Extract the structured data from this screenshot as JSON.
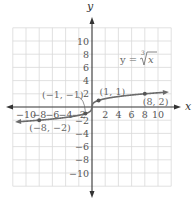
{
  "chart_data": {
    "type": "line",
    "title": "",
    "function": "y = cbrt(x)",
    "equation_label": {
      "prefix": "y = ",
      "index": "3",
      "radicand": "x"
    },
    "xlabel": "x",
    "ylabel": "y",
    "xlim": [
      -12,
      12
    ],
    "ylim": [
      -12,
      12
    ],
    "grid": true,
    "grid_step": 2,
    "x_ticks": [
      {
        "value": -10,
        "label": "−10"
      },
      {
        "value": -8,
        "label": "−8"
      },
      {
        "value": -6,
        "label": "−6"
      },
      {
        "value": -4,
        "label": "−4"
      },
      {
        "value": -2,
        "label": "−2"
      },
      {
        "value": 2,
        "label": "2"
      },
      {
        "value": 4,
        "label": "4"
      },
      {
        "value": 6,
        "label": "6"
      },
      {
        "value": 8,
        "label": "8"
      },
      {
        "value": 10,
        "label": "10"
      }
    ],
    "y_ticks": [
      {
        "value": 10,
        "label": "10"
      },
      {
        "value": 8,
        "label": "8"
      },
      {
        "value": 6,
        "label": "6"
      },
      {
        "value": 4,
        "label": "4"
      },
      {
        "value": 2,
        "label": "2"
      },
      {
        "value": -2,
        "label": "−2"
      },
      {
        "value": -4,
        "label": "−4"
      },
      {
        "value": -6,
        "label": "−6"
      },
      {
        "value": -8,
        "label": "−8"
      },
      {
        "value": -10,
        "label": "−10"
      }
    ],
    "series": [
      {
        "name": "y = ∛x",
        "x_range": [
          -11.2,
          11.2
        ],
        "arrows": "both",
        "color": "#6b6b6b"
      }
    ],
    "points": [
      {
        "x": -8,
        "y": -2,
        "label": "(−8, −2)"
      },
      {
        "x": -1,
        "y": -1,
        "label": "(−1, −1)"
      },
      {
        "x": 1,
        "y": 1,
        "label": "(1, 1)"
      },
      {
        "x": 8,
        "y": 2,
        "label": "(8, 2)"
      }
    ]
  },
  "colors": {
    "grid": "#d9d9d9",
    "axis": "#333333",
    "curve": "#6b6b6b",
    "text": "#666666"
  }
}
